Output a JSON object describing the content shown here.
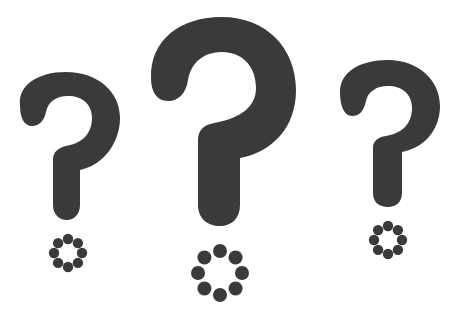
{
  "illustration": {
    "description": "Three question marks with dotted-ring dots",
    "background": "#ffffff",
    "ink_color": "#3a3a3a",
    "question_marks": [
      {
        "name": "left",
        "ring": {
          "cx": 68,
          "cy": 253,
          "r": 14,
          "dot_r": 5.2,
          "dots": 8
        }
      },
      {
        "name": "center",
        "ring": {
          "cx": 220,
          "cy": 273,
          "r": 22,
          "dot_r": 7,
          "dots": 8
        }
      },
      {
        "name": "right",
        "ring": {
          "cx": 388,
          "cy": 240,
          "r": 14,
          "dot_r": 5.2,
          "dots": 8
        }
      }
    ]
  }
}
